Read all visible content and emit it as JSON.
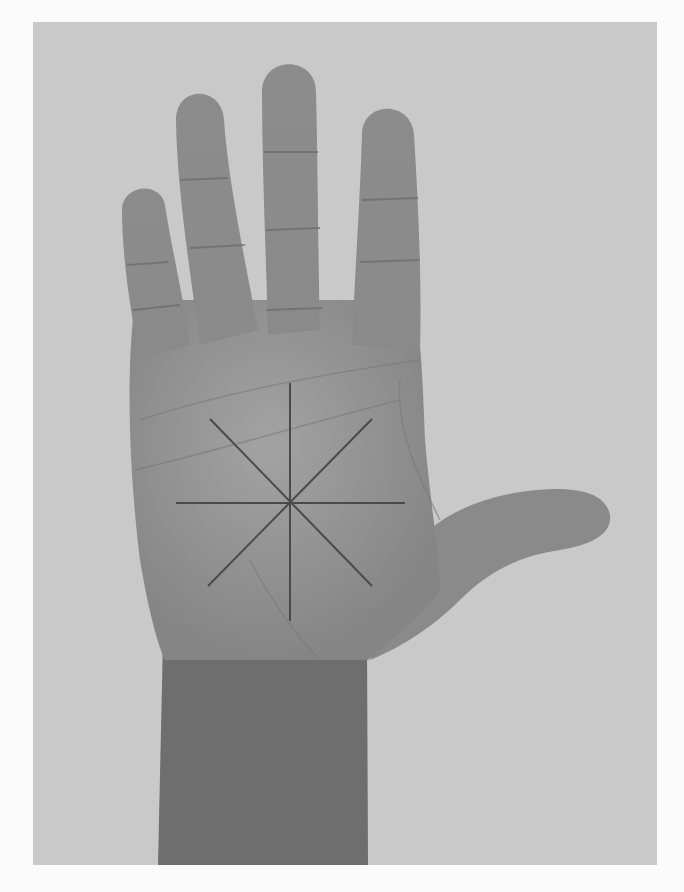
{
  "figure": {
    "style": "grayscale photograph",
    "background_color": "#c9c9c9",
    "page_color": "#fbfbfb",
    "skin_tone_mid": "#8f8f8f",
    "skin_tone_dark": "#6e6e6e",
    "overlay": {
      "shape": "eight-pointed star (asterisk) of straight lines",
      "line_color": "#4a4a4a",
      "center": [
        290,
        503
      ],
      "line_count": 4
    }
  }
}
